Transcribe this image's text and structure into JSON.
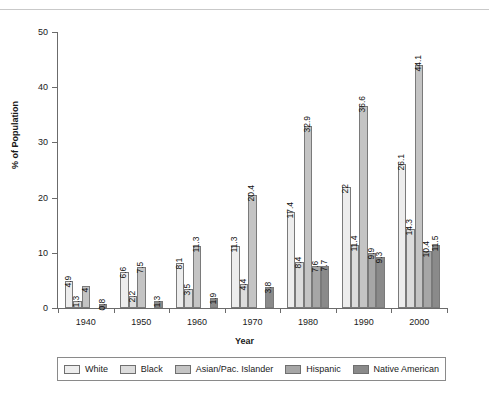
{
  "top_cut_text": "",
  "chart_data": {
    "type": "bar",
    "title": "",
    "xlabel": "Year",
    "ylabel": "% of Population",
    "ylim": [
      0,
      50
    ],
    "yticks": [
      0,
      10,
      20,
      30,
      40,
      50
    ],
    "grid": false,
    "legend_position": "bottom",
    "categories": [
      "1940",
      "1950",
      "1960",
      "1970",
      "1980",
      "1990",
      "2000"
    ],
    "series": [
      {
        "name": "White",
        "color": "#ededed",
        "values": [
          4.9,
          6.6,
          8.1,
          11.3,
          17.4,
          22,
          26.1
        ],
        "labels": [
          "4.9",
          "6.6",
          "8.1",
          "11.3",
          "17.4",
          "22",
          "26.1"
        ]
      },
      {
        "name": "Black",
        "color": "#dcdcdc",
        "values": [
          1.3,
          2.2,
          3.5,
          4.4,
          8.4,
          11.4,
          14.3
        ],
        "labels": [
          "1.3",
          "2.2",
          "3.5",
          "4.4",
          "8.4",
          "11.4",
          "14.3"
        ]
      },
      {
        "name": "Asian/Pac. Islander",
        "color": "#c4c4c4",
        "values": [
          4,
          7.5,
          11.3,
          20.4,
          32.9,
          36.6,
          44.1
        ],
        "labels": [
          "4",
          "7.5",
          "11.3",
          "20.4",
          "32.9",
          "36.6",
          "44.1"
        ]
      },
      {
        "name": "Hispanic",
        "color": "#a6a6a6",
        "values": [
          0,
          0,
          0,
          0,
          7.6,
          9.9,
          10.4
        ],
        "labels": [
          "",
          "",
          "",
          "",
          "7.6",
          "9.9",
          "10.4"
        ]
      },
      {
        "name": "Native American",
        "color": "#8a8a8a",
        "values": [
          0.8,
          1.3,
          1.9,
          3.8,
          7.7,
          9.3,
          11.5
        ],
        "labels": [
          "0.8",
          "1.3",
          "1.9",
          "3.8",
          "7.7",
          "9.3",
          "11.5"
        ]
      }
    ]
  }
}
